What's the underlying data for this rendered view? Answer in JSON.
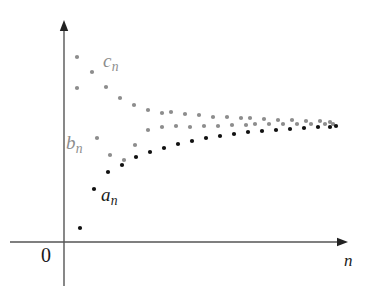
{
  "figure": {
    "background_color": "#ffffff"
  },
  "axes": {
    "origin_label": "0",
    "x_axis_label": "n",
    "y_axis_label": "",
    "axis_color": "#555555",
    "x_axis_y_px": 242,
    "y_axis_x_px": 64,
    "x_axis_from_px": 10,
    "x_axis_to_px": 348,
    "y_axis_top_px": 20,
    "y_axis_bottom_px": 286,
    "arrowheads": [
      "x-axis-right",
      "y-axis-up"
    ],
    "ticks": [],
    "grid": false
  },
  "series_labels": {
    "a": {
      "base": "a",
      "sub": "n",
      "color": "#1a1a1a"
    },
    "b": {
      "base": "b",
      "sub": "n",
      "color": "#8d8d8d"
    },
    "c": {
      "base": "c",
      "sub": "n",
      "color": "#8d8d8d"
    }
  },
  "colors": {
    "black": "#111111",
    "gray": "#8d8d8d",
    "axis": "#555555"
  },
  "chart_data": {
    "type": "scatter",
    "title": "",
    "xlabel": "n",
    "ylabel": "",
    "xlim": [
      0,
      30
    ],
    "ylim": [
      0,
      1
    ],
    "grid": false,
    "legend": "inline-annotations",
    "annotations": [
      {
        "text": "c_n",
        "x_px": 115,
        "y_px": 62,
        "color": "#8d8d8d"
      },
      {
        "text": "b_n",
        "x_px": 78,
        "y_px": 145,
        "color": "#8d8d8d"
      },
      {
        "text": "a_n",
        "x_px": 112,
        "y_px": 196,
        "color": "#1a1a1a"
      }
    ],
    "series": [
      {
        "name": "c_n",
        "color": "#8d8d8d",
        "marker": "dot",
        "description": "decreasing sequence approaching the limit from above",
        "points_px": [
          [
            77,
            57
          ],
          [
            92,
            72
          ],
          [
            106,
            87
          ],
          [
            120,
            98
          ],
          [
            134,
            105
          ],
          [
            148,
            110
          ],
          [
            162,
            113
          ],
          [
            171,
            112
          ],
          [
            185,
            114
          ],
          [
            199,
            115
          ],
          [
            213,
            117
          ],
          [
            227,
            117
          ],
          [
            241,
            118
          ],
          [
            250,
            118
          ],
          [
            264,
            119
          ],
          [
            278,
            120
          ],
          [
            292,
            120
          ],
          [
            306,
            121
          ],
          [
            320,
            121
          ],
          [
            330,
            122
          ]
        ]
      },
      {
        "name": "b_n",
        "color": "#8d8d8d",
        "marker": "dot",
        "description": "increasing gray sequence approaching the limit from below",
        "points_px": [
          [
            77,
            88
          ],
          [
            97,
            138
          ],
          [
            110,
            155
          ],
          [
            124,
            160
          ],
          [
            135,
            145
          ],
          [
            148,
            130
          ],
          [
            162,
            127
          ],
          [
            176,
            126
          ],
          [
            190,
            127
          ],
          [
            204,
            126
          ],
          [
            218,
            126
          ],
          [
            232,
            125
          ],
          [
            246,
            125
          ],
          [
            255,
            124
          ],
          [
            269,
            124
          ],
          [
            283,
            124
          ],
          [
            297,
            124
          ],
          [
            311,
            124
          ],
          [
            325,
            124
          ],
          [
            333,
            124
          ]
        ]
      },
      {
        "name": "a_n",
        "color": "#111111",
        "marker": "dot",
        "description": "increasing black sequence approaching the limit from below",
        "points_px": [
          [
            94,
            189
          ],
          [
            80,
            228
          ],
          [
            108,
            172
          ],
          [
            122,
            165
          ],
          [
            136,
            157
          ],
          [
            150,
            152
          ],
          [
            164,
            148
          ],
          [
            178,
            144
          ],
          [
            192,
            141
          ],
          [
            206,
            138
          ],
          [
            220,
            136
          ],
          [
            234,
            134
          ],
          [
            248,
            132
          ],
          [
            262,
            131
          ],
          [
            276,
            130
          ],
          [
            290,
            129
          ],
          [
            304,
            128
          ],
          [
            318,
            127
          ],
          [
            330,
            127
          ],
          [
            336,
            126
          ]
        ]
      }
    ]
  }
}
